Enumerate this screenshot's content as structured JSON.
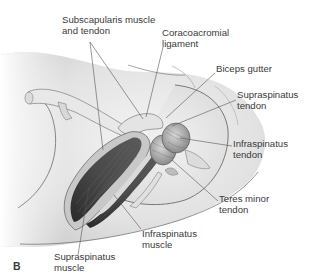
{
  "figure": {
    "panel_label": "B",
    "labels": [
      {
        "id": "subscapularis",
        "line1": "Subscapularis muscle",
        "line2": "and tendon"
      },
      {
        "id": "coracoacromial",
        "line1": "Coracoacromial",
        "line2": "ligament"
      },
      {
        "id": "biceps-gutter",
        "line1": "Biceps gutter",
        "line2": ""
      },
      {
        "id": "supraspinatus-tendon",
        "line1": "Supraspinatus",
        "line2": "tendon"
      },
      {
        "id": "infraspinatus-tendon",
        "line1": "Infraspinatus",
        "line2": "tendon"
      },
      {
        "id": "teres-minor-tendon",
        "line1": "Teres minor",
        "line2": "tendon"
      },
      {
        "id": "infraspinatus-muscle",
        "line1": "Infraspinatus",
        "line2": "muscle"
      },
      {
        "id": "supraspinatus-muscle",
        "line1": "Supraspinatus",
        "line2": "muscle"
      }
    ]
  }
}
